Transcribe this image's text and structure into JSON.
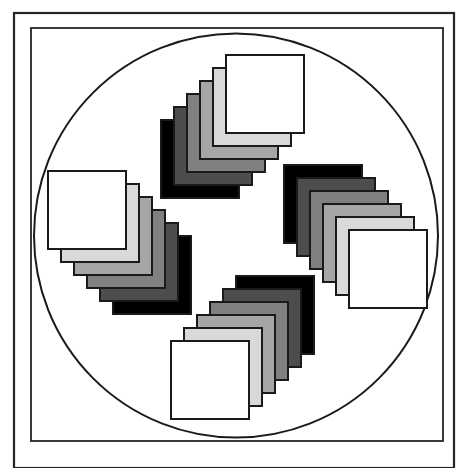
{
  "figure": {
    "title": "Pinwheel arrangement of four graduated square stacks within a circle",
    "background_color": "#ffffff",
    "stroke_color": "#1a1a1a",
    "canvas": {
      "width": 465,
      "height": 468
    }
  },
  "frames": [
    {
      "name": "outer-border-rect",
      "x": 14,
      "y": 13,
      "width": 440,
      "height": 455,
      "stroke_width": 2.2,
      "stroke_color": "#242424",
      "fill": "none"
    },
    {
      "name": "inner-border-rect",
      "x": 31,
      "y": 28,
      "width": 412,
      "height": 413,
      "stroke_width": 1.8,
      "stroke_color": "#242424",
      "fill": "none"
    }
  ],
  "circle": {
    "name": "enclosing-circle",
    "cx": 236,
    "cy": 235.5,
    "r": 202,
    "stroke_width": 2.0,
    "stroke_color": "#1a1a1a",
    "fill": "none"
  },
  "stacks": {
    "count": 4,
    "cards_per_stack": 6,
    "card_size": 78,
    "card_stroke_color": "#1a1a1a",
    "card_stroke_width": 1.6,
    "offset_step": 13,
    "shades": [
      "#000000",
      "#4d4d4d",
      "#808080",
      "#a6a6a6",
      "#d9d9d9",
      "#ffffff"
    ],
    "shade_labels": [
      "black",
      "dark-gray",
      "mid-gray",
      "gray",
      "light-gray",
      "white"
    ],
    "items": [
      {
        "name": "stack-top",
        "position": "top",
        "front_card_x": 226,
        "front_card_y": 55,
        "dx": -13,
        "dy": 13,
        "front_shade": "#ffffff",
        "back_shade": "#000000",
        "direction": "back layers extend down-left"
      },
      {
        "name": "stack-right",
        "position": "right",
        "front_card_x": 349,
        "front_card_y": 230,
        "dx": -13,
        "dy": -13,
        "front_shade": "#ffffff",
        "back_shade": "#000000",
        "direction": "back layers extend up-left"
      },
      {
        "name": "stack-bottom",
        "position": "bottom",
        "front_card_x": 171,
        "front_card_y": 341,
        "dx": 13,
        "dy": -13,
        "front_shade": "#ffffff",
        "back_shade": "#000000",
        "direction": "back layers extend up-right"
      },
      {
        "name": "stack-left",
        "position": "left",
        "front_card_x": 48,
        "front_card_y": 171,
        "dx": 13,
        "dy": 13,
        "front_shade": "#ffffff",
        "back_shade": "#000000",
        "direction": "back layers extend down-right"
      }
    ]
  }
}
